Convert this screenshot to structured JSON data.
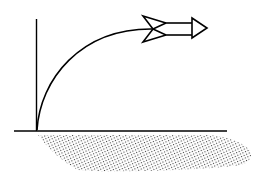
{
  "diagram": {
    "description": "Rocket launched from the ground following a curved trajectory",
    "elements": [
      {
        "name": "vertical-axis",
        "type": "line"
      },
      {
        "name": "ground-line",
        "type": "line"
      },
      {
        "name": "trajectory-curve",
        "type": "curve"
      },
      {
        "name": "rocket",
        "type": "icon"
      },
      {
        "name": "ground-soil",
        "type": "stippled-region"
      }
    ],
    "colors": {
      "stroke": "#000000",
      "background": "#ffffff",
      "stipple": "#444444"
    }
  }
}
